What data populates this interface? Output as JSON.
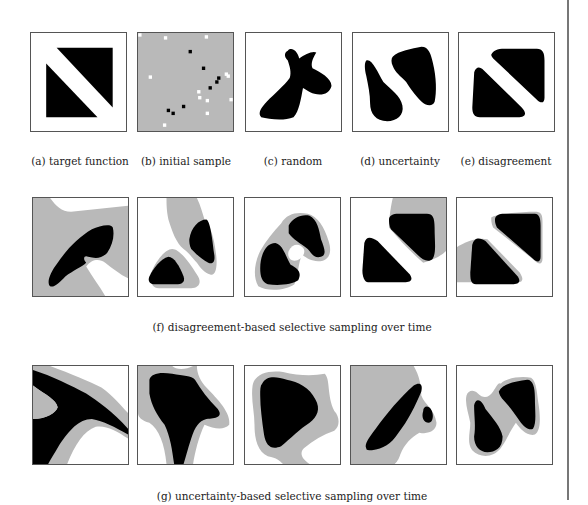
{
  "colors": {
    "positive": "#000000",
    "uncertain": "#b9b9b9",
    "negative": "#ffffff",
    "border": "#555555"
  },
  "row1": {
    "captions": [
      "(a) target function",
      "(b) initial sample",
      "(c) random",
      "(d) uncertainty",
      "(e) disagreement"
    ]
  },
  "row2": {
    "caption": "(f) disagreement-based selective sampling over time",
    "panel_count": 5
  },
  "row3": {
    "caption": "(g) uncertainty-based selective sampling over time",
    "panel_count": 5
  },
  "initial_sample": {
    "positive_points": [
      [
        0.55,
        0.19
      ],
      [
        0.69,
        0.36
      ],
      [
        0.76,
        0.56
      ],
      [
        0.83,
        0.5
      ],
      [
        0.85,
        0.46
      ],
      [
        0.48,
        0.75
      ],
      [
        0.32,
        0.79
      ],
      [
        0.37,
        0.82
      ]
    ],
    "negative_points": [
      [
        0.29,
        0.05
      ],
      [
        0.72,
        0.04
      ],
      [
        0.13,
        0.45
      ],
      [
        0.93,
        0.42
      ],
      [
        0.95,
        0.44
      ],
      [
        0.64,
        0.6
      ],
      [
        0.65,
        0.66
      ],
      [
        0.73,
        0.69
      ],
      [
        0.73,
        0.82
      ],
      [
        0.28,
        0.94
      ],
      [
        0.98,
        0.68
      ],
      [
        0.02,
        0.02
      ]
    ]
  }
}
